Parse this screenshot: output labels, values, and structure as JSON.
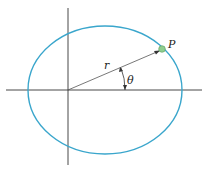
{
  "diagram": {
    "type": "polar coordinate ellipse",
    "labels": {
      "point": "P",
      "radius": "r",
      "angle": "θ"
    },
    "colors": {
      "ellipse": "#3aa6cc",
      "axes": "#333333",
      "point": "#8fce8f",
      "vector": "#555555"
    }
  }
}
